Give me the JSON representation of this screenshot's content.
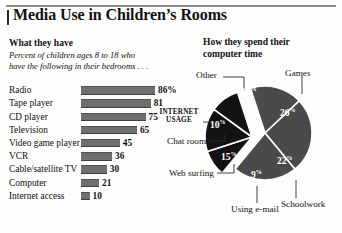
{
  "header": {
    "title": "Media Use in Children’s Rooms"
  },
  "left_panel": {
    "heading": "What they have",
    "desc_line1": "Percent of children ages 8 to 18 who",
    "desc_line2": "have the following in their bedrooms . . ."
  },
  "right_panel": {
    "heading_line1": "How they spend their",
    "heading_line2": "computer time",
    "internet_label_line1": "INTERNET",
    "internet_label_line2": "USAGE"
  },
  "colors": {
    "bar_fill": "#6f6f6f",
    "pie_gray": "#4a4a4a",
    "pie_black": "#121212",
    "rule": "#8e8e8e",
    "text": "#121212",
    "background": "#fdfdfb"
  },
  "chart_data": [
    {
      "type": "bar",
      "title": "What they have",
      "subtitle": "Percent of children ages 8 to 18 who have the following in their bedrooms . . .",
      "orientation": "horizontal",
      "xlabel": "",
      "ylabel": "",
      "xlim": [
        0,
        100
      ],
      "grid": false,
      "categories": [
        "Radio",
        "Tape player",
        "CD player",
        "Television",
        "Video game player",
        "VCR",
        "Cable/satellite TV",
        "Computer",
        "Internet access"
      ],
      "values": [
        86,
        81,
        75,
        65,
        45,
        36,
        30,
        21,
        10
      ],
      "value_labels": [
        "86%",
        "81",
        "75",
        "65",
        "45",
        "36",
        "30",
        "21",
        "10"
      ]
    },
    {
      "type": "pie",
      "title": "How they spend their computer time",
      "legend": "outside-labels",
      "labels": [
        "Games",
        "Schoolwork",
        "Using e-mail",
        "Web surfing",
        "Chat rooms",
        "Other"
      ],
      "values": [
        26,
        22,
        9,
        15,
        10,
        18
      ],
      "value_labels": [
        "26%",
        "22%",
        "9%",
        "15%",
        "10%",
        "18%"
      ],
      "group_label": "INTERNET USAGE",
      "group_members": [
        "Chat rooms",
        "Web surfing",
        "Using e-mail"
      ],
      "group_exploded": true
    }
  ]
}
